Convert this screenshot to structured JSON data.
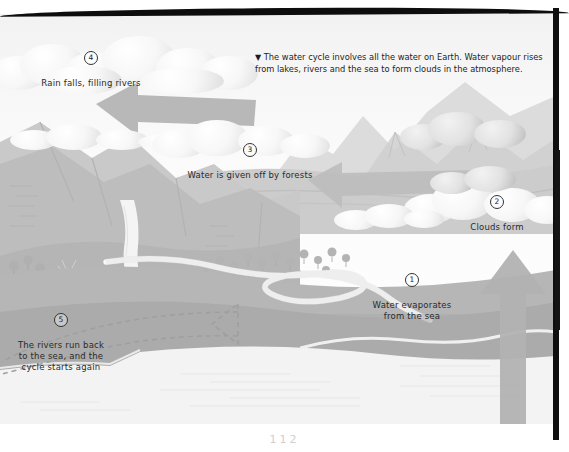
{
  "figure": {
    "caption_marker": "▼",
    "caption_text": "The water cycle involves all the water on Earth. Water vapour rises from lakes, rivers and the sea to form clouds in the atmosphere.",
    "page_number": "112"
  },
  "steps": [
    {
      "number": "1",
      "text": "Water evaporates\nfrom the sea"
    },
    {
      "number": "2",
      "text": "Clouds form"
    },
    {
      "number": "3",
      "text": "Water is given off by forests"
    },
    {
      "number": "4",
      "text": "Rain falls, filling rivers"
    },
    {
      "number": "5",
      "text": "The rivers run back\nto the sea, and the\ncycle starts again"
    }
  ],
  "scene": {
    "elements": [
      "sky",
      "clouds",
      "rain-clouds",
      "mountains",
      "forest",
      "waterfall",
      "river",
      "sea",
      "coastline",
      "underground-flow"
    ],
    "arrows": [
      {
        "name": "cloud-drift-upper",
        "direction": "left"
      },
      {
        "name": "cloud-drift-middle",
        "direction": "left"
      },
      {
        "name": "evaporation-rise",
        "direction": "up"
      },
      {
        "name": "groundwater-return",
        "direction": "left",
        "style": "dashed"
      }
    ]
  },
  "colors": {
    "paper": "#ffffff",
    "sky": "#f6f6f6",
    "cloud_light": "#fbfbfb",
    "cloud_shadow": "#d6d6d6",
    "mountain_far": "#d8d8d8",
    "mountain_mid": "#c4c4c4",
    "land": "#b9b9b9",
    "sea": "#eeeeee",
    "arrow": "#b0b0b0",
    "ink": "#2a2a2a",
    "border": "#111111"
  }
}
